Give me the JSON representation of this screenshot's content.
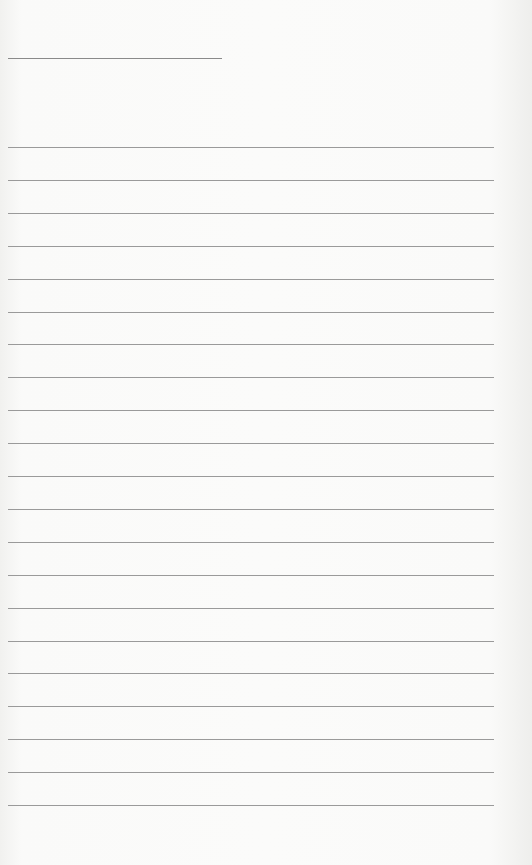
{
  "page": {
    "type": "lined-paper",
    "title_line": {
      "width": 214
    },
    "ruled_lines": {
      "count": 21,
      "first_y": 147,
      "spacing": 32.9
    },
    "text": ""
  }
}
